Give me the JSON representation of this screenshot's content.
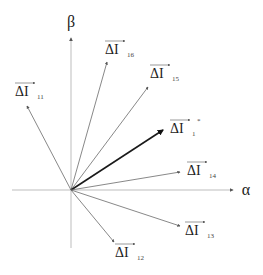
{
  "diagram": {
    "type": "vector-diagram",
    "origin": {
      "x": 71,
      "y": 190
    },
    "colors": {
      "axis": "#bdbdbd",
      "vector": "#6a6a6a",
      "highlight": "#1a1a1a",
      "text": "#222222"
    },
    "axes": {
      "alpha": {
        "label": "α",
        "x1": 12,
        "y1": 190,
        "x2": 233,
        "y2": 190,
        "lx": 246,
        "ly": 195
      },
      "beta": {
        "label": "β",
        "x1": 71,
        "y1": 248,
        "x2": 71,
        "y2": 38,
        "lx": 71,
        "ly": 27
      }
    },
    "vectors": [
      {
        "id": "11",
        "main": "ΔI",
        "sub": "11",
        "x": 27,
        "y": 106,
        "lx": 15,
        "ly": 96,
        "bold": false
      },
      {
        "id": "16",
        "main": "ΔI",
        "sub": "16",
        "x": 107,
        "y": 62,
        "lx": 105,
        "ly": 54,
        "bold": false
      },
      {
        "id": "15",
        "main": "ΔI",
        "sub": "15",
        "x": 148,
        "y": 87,
        "lx": 150,
        "ly": 78,
        "bold": false
      },
      {
        "id": "1",
        "main": "ΔI",
        "sub": "1",
        "sup": "*",
        "x": 163,
        "y": 130,
        "lx": 170,
        "ly": 133,
        "bold": true
      },
      {
        "id": "14",
        "main": "ΔI",
        "sub": "14",
        "x": 180,
        "y": 172,
        "lx": 187,
        "ly": 175,
        "bold": false
      },
      {
        "id": "13",
        "main": "ΔI",
        "sub": "13",
        "x": 180,
        "y": 226,
        "lx": 185,
        "ly": 235,
        "bold": false
      },
      {
        "id": "12",
        "main": "ΔI",
        "sub": "12",
        "x": 114,
        "y": 242,
        "lx": 115,
        "ly": 257,
        "bold": false
      }
    ]
  }
}
